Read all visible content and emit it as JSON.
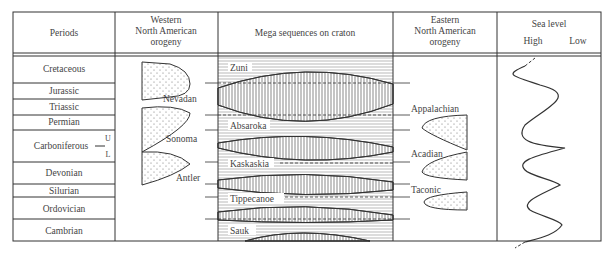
{
  "headers": {
    "periods": "Periods",
    "western": [
      "Western",
      "North American",
      "orogeny"
    ],
    "mega": "Mega sequences on craton",
    "eastern": [
      "Eastern",
      "North American",
      "orogeny"
    ],
    "sealevel": "Sea level",
    "high": "High",
    "low": "Low"
  },
  "periods": [
    {
      "name": "Cretaceous",
      "top": 56,
      "bottom": 83
    },
    {
      "name": "Jurassic",
      "top": 83,
      "bottom": 99
    },
    {
      "name": "Triassic",
      "top": 99,
      "bottom": 115
    },
    {
      "name": "Permian",
      "top": 115,
      "bottom": 130
    },
    {
      "name": "Carboniferous",
      "top": 130,
      "bottom": 162
    },
    {
      "name": "Devonian",
      "top": 162,
      "bottom": 184
    },
    {
      "name": "Silurian",
      "top": 184,
      "bottom": 197
    },
    {
      "name": "Ordovician",
      "top": 197,
      "bottom": 219
    },
    {
      "name": "Cambrian",
      "top": 219,
      "bottom": 241
    }
  ],
  "carboniferous_sub": {
    "upper": "U",
    "lower": "L"
  },
  "western_orogenies": [
    "Nevadan",
    "Sonoma",
    "Antler"
  ],
  "megasequences": [
    "Zuni",
    "Absaroka",
    "Kaskaskia",
    "Tippecanoe",
    "Sauk"
  ],
  "eastern_orogenies": [
    "Appalachian",
    "Acadian",
    "Taconic"
  ]
}
